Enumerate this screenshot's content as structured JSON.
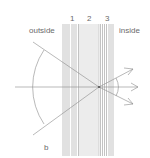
{
  "diagram": {
    "labels": {
      "outside": "outside",
      "inside": "inside",
      "b": "b",
      "layer1": "1",
      "layer2": "2",
      "layer3": "3"
    },
    "colors": {
      "line": "#8a8a8a",
      "band": "#ececec",
      "text": "#6a6a6a"
    },
    "layers": [
      {
        "id": "1",
        "type": "thin-lines"
      },
      {
        "id": "2",
        "type": "shaded-band"
      },
      {
        "id": "3",
        "type": "thin-lines"
      }
    ]
  }
}
